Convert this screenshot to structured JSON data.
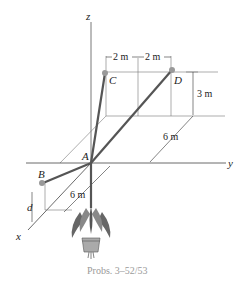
{
  "figure": {
    "caption": "Probs. 3–52/53",
    "axes": {
      "x": "x",
      "y": "y",
      "z": "z"
    },
    "points": {
      "A": "A",
      "B": "B",
      "C": "C",
      "D": "D"
    },
    "dimensions": {
      "cd_left": "2 m",
      "cd_right": "2 m",
      "height_d": "3 m",
      "depth_y": "6 m",
      "depth_x": "6 m",
      "d_label": "d"
    },
    "colors": {
      "line": "#333333",
      "cable": "#555555",
      "caption": "#9a9a9a"
    }
  }
}
